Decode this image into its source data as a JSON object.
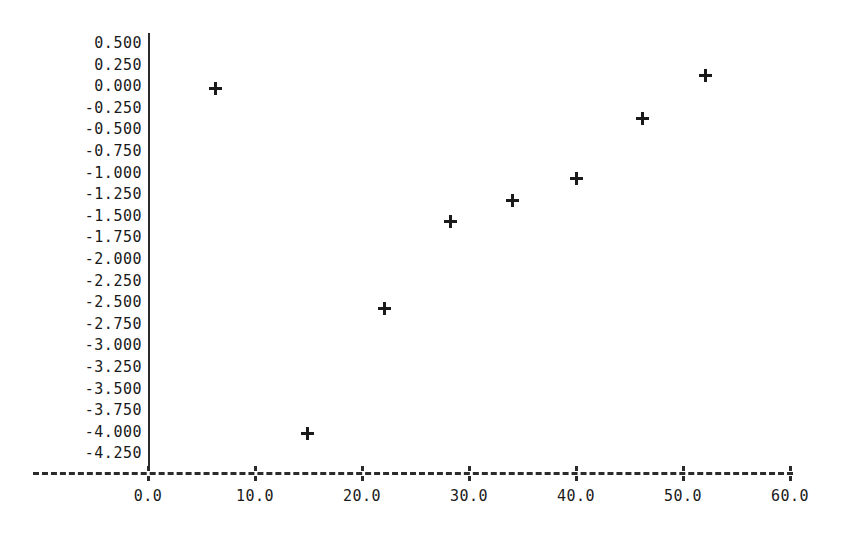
{
  "chart_data": {
    "type": "scatter",
    "title": "",
    "subtitle": "",
    "xlabel": "",
    "ylabel": "",
    "xlim": [
      -1.5,
      61.0
    ],
    "ylim": [
      -4.45,
      0.6
    ],
    "grid": false,
    "legend": null,
    "marker": "+",
    "marker_color": "#1a1a1a",
    "axis_color": "#2b2b2b",
    "background_color": "#ffffff",
    "x_tick_labels": [
      "0.0",
      "10.0",
      "20.0",
      "30.0",
      "40.0",
      "50.0",
      "60.0"
    ],
    "x_tick_values": [
      0.0,
      10.0,
      20.0,
      30.0,
      40.0,
      50.0,
      60.0
    ],
    "y_tick_labels": [
      "0.500",
      "0.250",
      "0.000",
      "-0.250",
      "-0.500",
      "-0.750",
      "-1.000",
      "-1.250",
      "-1.500",
      "-1.750",
      "-2.000",
      "-2.250",
      "-2.500",
      "-2.750",
      "-3.000",
      "-3.250",
      "-3.500",
      "-3.750",
      "-4.000",
      "-4.250"
    ],
    "y_tick_values": [
      0.5,
      0.25,
      0.0,
      -0.25,
      -0.5,
      -0.75,
      -1.0,
      -1.25,
      -1.5,
      -1.75,
      -2.0,
      -2.25,
      -2.5,
      -2.75,
      -3.0,
      -3.25,
      -3.5,
      -3.75,
      -4.0,
      -4.25
    ],
    "x": [
      6.3,
      14.9,
      22.1,
      28.3,
      34.1,
      40.0,
      46.2,
      52.1
    ],
    "y": [
      0.0,
      -4.0,
      -2.55,
      -1.55,
      -1.3,
      -1.05,
      -0.35,
      0.15
    ],
    "points": [
      {
        "x": 6.3,
        "y": 0.0
      },
      {
        "x": 14.9,
        "y": -4.0
      },
      {
        "x": 22.1,
        "y": -2.55
      },
      {
        "x": 28.3,
        "y": -1.55
      },
      {
        "x": 34.1,
        "y": -1.3
      },
      {
        "x": 40.0,
        "y": -1.05
      },
      {
        "x": 46.2,
        "y": -0.35
      },
      {
        "x": 52.1,
        "y": 0.15
      }
    ]
  }
}
